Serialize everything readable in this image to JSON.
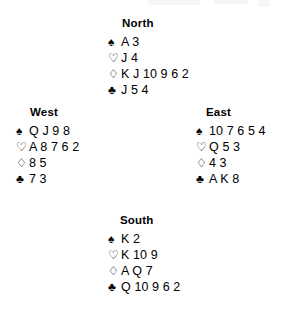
{
  "diagram": {
    "type": "bridge-hand-diagram",
    "suit_symbols": {
      "spade": "♠",
      "heart": "♡",
      "diamond": "♢",
      "club": "♣"
    },
    "hands": {
      "north": {
        "label": "North",
        "spades": "A 3",
        "hearts": "J 4",
        "diamonds": "K J 10 9 6 2",
        "clubs": "J 5 4"
      },
      "west": {
        "label": "West",
        "spades": "Q J 9 8",
        "hearts": "A 8 7 6 2",
        "diamonds": "8 5",
        "clubs": "7 3"
      },
      "east": {
        "label": "East",
        "spades": "10 7 6 5 4",
        "hearts": "Q 5 3",
        "diamonds": "4 3",
        "clubs": "A K 8"
      },
      "south": {
        "label": "South",
        "spades": "K 2",
        "hearts": "K 10 9",
        "diamonds": "A Q 7",
        "clubs": "Q 10 9 6 2"
      }
    }
  }
}
